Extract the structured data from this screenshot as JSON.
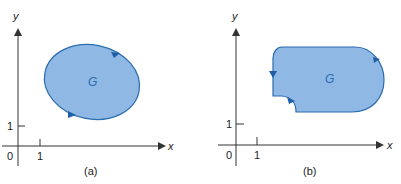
{
  "figure": {
    "colors": {
      "fill": "#8fb9e4",
      "stroke": "#2a6cae",
      "arrow": "#1f5fa8",
      "region_label": "#2a6cae",
      "axis": "#333333",
      "text": "#222222"
    },
    "panels": [
      {
        "id": "a",
        "caption": "(a)",
        "region_label": "G",
        "shape": "ellipse",
        "x_axis_label": "x",
        "y_axis_label": "y",
        "origin_label": "0",
        "x_tick_label": "1",
        "y_tick_label": "1",
        "orientation_arrows": 2
      },
      {
        "id": "b",
        "caption": "(b)",
        "region_label": "G",
        "shape": "rounded region with notch",
        "x_axis_label": "x",
        "y_axis_label": "y",
        "origin_label": "0",
        "x_tick_label": "1",
        "y_tick_label": "1",
        "orientation_arrows": 3
      }
    ]
  }
}
